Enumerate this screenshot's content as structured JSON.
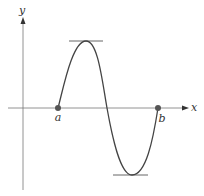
{
  "diagram": {
    "axes": {
      "x_label": "x",
      "y_label": "y"
    },
    "points": [
      {
        "label": "a",
        "x": 58,
        "y": 108
      },
      {
        "label": "b",
        "x": 158,
        "y": 108
      }
    ],
    "features": {
      "maximum": {
        "x": 86,
        "y": 41,
        "tangent": "horizontal"
      },
      "minimum": {
        "x": 132,
        "y": 175,
        "tangent": "horizontal"
      }
    },
    "colors": {
      "curve": "#444444",
      "axis": "#777777",
      "point": "#555555"
    }
  }
}
